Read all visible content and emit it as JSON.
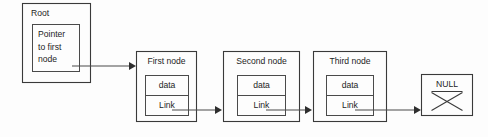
{
  "diagram": {
    "type": "linked-list",
    "colors": {
      "background": "#fdfdfd",
      "outline": "#3a3a3a",
      "inner_outline": "#4a4a4a",
      "text": "#1d1d1d",
      "arrow": "#2e2e2e"
    },
    "root": {
      "label": "Root",
      "pointer_lines": [
        "Pointer",
        "to first",
        "node"
      ],
      "pointer_text": "Pointer to first node"
    },
    "nodes": [
      {
        "title": "First node",
        "data_label": "data",
        "link_label": "Link"
      },
      {
        "title": "Second node",
        "data_label": "data",
        "link_label": "Link"
      },
      {
        "title": "Third node",
        "data_label": "data",
        "link_label": "Link"
      }
    ],
    "terminator": {
      "label": "NULL"
    }
  }
}
